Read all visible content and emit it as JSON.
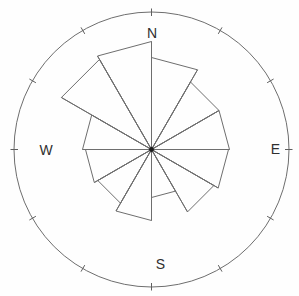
{
  "chart": {
    "title": "",
    "kind": "wind rose",
    "compass": [
      {
        "id": "n",
        "label": "N",
        "x": 152,
        "y": 33
      },
      {
        "id": "e",
        "label": "E",
        "x": 275.5,
        "y": 149
      },
      {
        "id": "s",
        "label": "S",
        "x": 160.5,
        "y": 264
      },
      {
        "id": "w",
        "label": "W",
        "x": 46,
        "y": 150
      }
    ]
  },
  "chart_data": {
    "type": "windrose",
    "title": "",
    "direction_labels": [
      "N",
      "E",
      "S",
      "W"
    ],
    "sector_span_deg": 30,
    "sector_start_deg_clockwise_from_north": [
      0,
      30,
      60,
      90,
      120,
      150,
      180,
      210,
      240,
      270,
      300,
      330
    ],
    "radii_px": [
      92,
      78,
      78,
      77,
      72,
      48,
      71,
      62,
      66,
      69,
      104,
      108
    ],
    "values_fraction_of_outer_circle": [
      0.67,
      0.57,
      0.57,
      0.56,
      0.52,
      0.35,
      0.52,
      0.45,
      0.48,
      0.5,
      0.76,
      0.79
    ],
    "outer_circle_radius_px": 137.5,
    "center_px": [
      151.5,
      149.5
    ],
    "tick_interval_deg": 30,
    "tick_inner_radius_px": 133.5,
    "tick_outer_radius_px": 141,
    "grid": "single outer circle with radial tick marks every 30 degrees, no radial scale labels"
  },
  "style": {
    "line_color": "#6e6e6e",
    "tick_color": "#5f5f5f",
    "label_color": "#2f2f2f",
    "center_dot_color": "#1c1c1c",
    "background": "#fefefe"
  }
}
